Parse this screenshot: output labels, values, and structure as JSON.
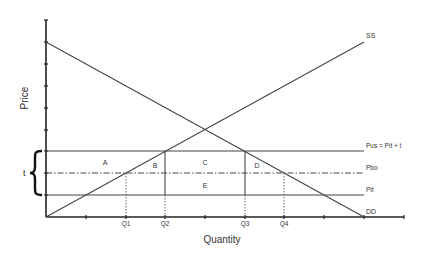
{
  "diagram": {
    "axes": {
      "xlabel": "Quantity",
      "ylabel": "Price"
    },
    "curves": {
      "supply_label": "SS",
      "demand_label": "DD"
    },
    "price_lines": {
      "pus_label": "Pus = Pit + t",
      "pbo_label": "Pbo",
      "pit_label": "Pit"
    },
    "tariff_label": "t",
    "areas": {
      "a": "A",
      "b": "B",
      "c": "C",
      "d": "D",
      "e": "E"
    },
    "quantity_ticks": {
      "q1": "Q1",
      "q2": "Q2",
      "q3": "Q3",
      "q4": "Q4"
    },
    "colors": {
      "line": "#444444",
      "axis": "#222222",
      "text": "#333333"
    }
  }
}
